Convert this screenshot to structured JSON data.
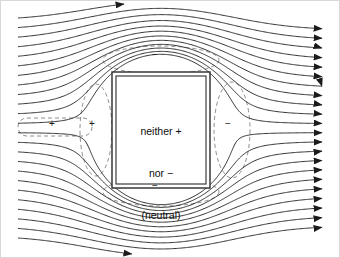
{
  "figure": {
    "background_color": "#ffffff",
    "frame_color": "#d8d8d8",
    "width": 340,
    "height": 258
  },
  "object_box": {
    "label_line1": "neither +",
    "label_line2": "nor −",
    "label_line3": "(neutral)",
    "border_style": "double",
    "border_color": "#2a2a2a",
    "fill": "#ffffff",
    "x": 112,
    "y": 72,
    "width": 98,
    "height": 116
  },
  "charge_markers": [
    {
      "name": "induced-positive-left-stub",
      "symbol": "+",
      "x": 52,
      "y": 124
    },
    {
      "name": "induced-positive-left",
      "symbol": "+",
      "x": 92,
      "y": 124
    },
    {
      "name": "induced-negative-right",
      "symbol": "−",
      "x": 228,
      "y": 124
    },
    {
      "name": "induced-negative-top",
      "symbol": "−",
      "x": 155,
      "y": 55
    },
    {
      "name": "induced-negative-bottom",
      "symbol": "−",
      "x": 155,
      "y": 186
    }
  ],
  "field": {
    "direction": "left-to-right",
    "line_count": 24,
    "line_color": "#1b1b1b",
    "line_width": 0.9,
    "arrowhead": "solid-triangle",
    "arrow_edge": "right",
    "left_margin": 18,
    "right_margin": 322,
    "top_line_y": 18,
    "bottom_line_y": 238
  },
  "dashed_contours": {
    "style": "dashed",
    "color": "#8e8e8e",
    "dash": "4 3",
    "items": [
      {
        "name": "contour-left-lobe",
        "shape": "ellipse",
        "cx": 96,
        "cy": 130,
        "rx": 16,
        "ry": 46
      },
      {
        "name": "contour-right-lobe",
        "shape": "ellipse",
        "cx": 232,
        "cy": 130,
        "rx": 18,
        "ry": 48
      },
      {
        "name": "contour-top-lobe",
        "shape": "ellipse",
        "cx": 161,
        "cy": 60,
        "rx": 58,
        "ry": 14
      },
      {
        "name": "contour-bottom-lobe",
        "shape": "ellipse",
        "cx": 161,
        "cy": 192,
        "rx": 58,
        "ry": 14
      },
      {
        "name": "contour-left-stub",
        "shape": "capsule",
        "x": 18,
        "y": 118,
        "width": 74,
        "height": 18
      }
    ]
  }
}
